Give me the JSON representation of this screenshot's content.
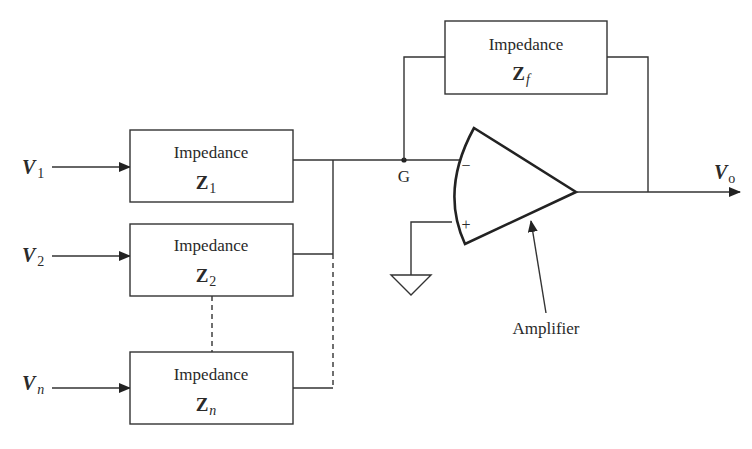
{
  "diagram": {
    "inputs": [
      {
        "symbol": "V",
        "subscript": "1",
        "box_label": "Impedance",
        "impedance_symbol": "Z",
        "impedance_subscript": "1"
      },
      {
        "symbol": "V",
        "subscript": "2",
        "box_label": "Impedance",
        "impedance_symbol": "Z",
        "impedance_subscript": "2"
      },
      {
        "symbol": "V",
        "subscript": "n",
        "box_label": "Impedance",
        "impedance_symbol": "Z",
        "impedance_subscript": "n"
      }
    ],
    "feedback": {
      "box_label": "Impedance",
      "impedance_symbol": "Z",
      "impedance_subscript": "f"
    },
    "node_label": "G",
    "amplifier": {
      "label": "Amplifier",
      "inverting_sign": "−",
      "noninverting_sign": "+"
    },
    "output": {
      "symbol": "V",
      "subscript": "o"
    },
    "ground": "ground-symbol",
    "colors": {
      "line": "#333333",
      "background": "#ffffff",
      "text": "#2a2a2a"
    }
  }
}
